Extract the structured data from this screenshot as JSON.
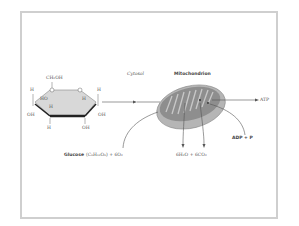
{
  "figure": {
    "glucose_molecule": {
      "top_group": "CH₂OH",
      "left_top": "H",
      "left_bottom": "OH",
      "inner_left_top": "HO",
      "inner_left_bottom": "H",
      "inner_right": "H",
      "right_top": "H",
      "right_bottom": "OH",
      "bottom_left": "H",
      "bottom_right": "OH"
    },
    "region_labels": {
      "cytosol": "Cytosol",
      "mitochondrion": "Mitochondrion"
    },
    "outputs": {
      "atp": "ATP",
      "adp": "ADP + P"
    },
    "reaction": {
      "glucose_label": "Glucose",
      "glucose_formula": "(C₆H₁₂O₆) + 6O₂",
      "products": "6H₂O + 6CO₂"
    },
    "colors": {
      "frame": "#cfcfcf",
      "ring_fill": "#d8d8d8",
      "ring_bold_edge": "#222222",
      "mito_outer": "#9a9a9a",
      "mito_inner": "#7d7d7d",
      "arrow": "#555555"
    }
  }
}
